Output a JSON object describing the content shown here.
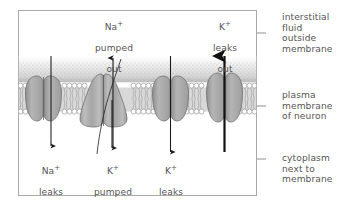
{
  "diagram": {
    "colors": {
      "frame_border": "#a9a9a9",
      "text": "#555555",
      "protein_fill": "#a8a8a8",
      "protein_stroke": "#6e6e6e",
      "membrane_tail": "#b4b4b4",
      "head_fill": "#ffffff",
      "head_stroke": "#8c8c8c",
      "stipple": "#cccccc",
      "arrow": "#1a1a1a"
    }
  },
  "labels": {
    "top_inside": [
      {
        "id": "na-pumped-out",
        "ion": "Na",
        "charge": "+",
        "lines": [
          "pumped",
          "out"
        ]
      },
      {
        "id": "k-leaks-out",
        "ion": "K",
        "charge": "+",
        "lines": [
          "leaks",
          "out"
        ]
      }
    ],
    "bottom_inside": [
      {
        "id": "na-leaks-in",
        "ion": "Na",
        "charge": "+",
        "lines": [
          "leaks",
          "in"
        ]
      },
      {
        "id": "k-pumped-in",
        "ion": "K",
        "charge": "+",
        "lines": [
          "pumped",
          "in"
        ]
      },
      {
        "id": "k-leaks-in",
        "ion": "K",
        "charge": "+",
        "lines": [
          "leaks",
          "in"
        ]
      }
    ],
    "right_side": [
      {
        "id": "interstitial-fluid",
        "text": "interstitial\nfluid\noutside\nmembrane"
      },
      {
        "id": "plasma-membrane",
        "text": "plasma\nmembrane\nof neuron"
      },
      {
        "id": "cytoplasm",
        "text": "cytoplasm\nnext to\nmembrane"
      }
    ]
  },
  "structures": {
    "proteins": [
      {
        "id": "na-leak-channel",
        "kind": "leak-channel",
        "shape": "oval"
      },
      {
        "id": "sodium-potassium-pump",
        "kind": "pump",
        "shape": "teardrop"
      },
      {
        "id": "k-leak-channel-1",
        "kind": "leak-channel",
        "shape": "oval"
      },
      {
        "id": "k-leak-channel-2",
        "kind": "leak-channel",
        "shape": "oval"
      }
    ],
    "arrows": [
      {
        "id": "arrow-na-leaks-in",
        "direction": "down",
        "weight": "thin"
      },
      {
        "id": "arrow-na-pumped-out",
        "direction": "up",
        "weight": "thin"
      },
      {
        "id": "arrow-k-pumped-in",
        "direction": "down",
        "weight": "thin"
      },
      {
        "id": "arrow-k-leaks-in",
        "direction": "down",
        "weight": "thin"
      },
      {
        "id": "arrow-k-leaks-out",
        "direction": "up",
        "weight": "bold"
      }
    ]
  }
}
